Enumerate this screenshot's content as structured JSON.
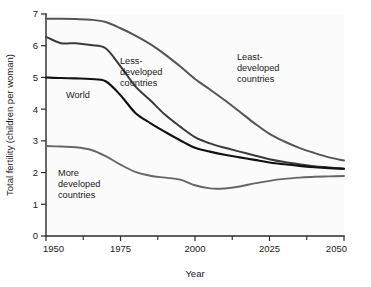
{
  "chart_data": {
    "type": "line",
    "title": "",
    "xlabel": "Year",
    "ylabel": "Total fertility (children per woman)",
    "xlim": [
      1950,
      2050
    ],
    "ylim": [
      0,
      7
    ],
    "grid": false,
    "legend_position": "inline-annotations",
    "x_ticks": [
      1950,
      1975,
      2000,
      2025,
      2050
    ],
    "x_minor_ticks": [
      1962.5,
      1987.5,
      2012.5,
      2037.5
    ],
    "y_ticks": [
      0,
      1,
      2,
      3,
      4,
      5,
      6,
      7
    ],
    "x": [
      1950,
      1955,
      1960,
      1965,
      1970,
      1975,
      1980,
      1985,
      1990,
      1995,
      2000,
      2005,
      2010,
      2015,
      2020,
      2025,
      2030,
      2035,
      2040,
      2045,
      2050
    ],
    "series": [
      {
        "name": "Least-developed countries",
        "color": "#555555",
        "width": 2.0,
        "values": [
          6.85,
          6.85,
          6.84,
          6.82,
          6.75,
          6.55,
          6.32,
          6.05,
          5.72,
          5.35,
          4.95,
          4.62,
          4.28,
          3.92,
          3.55,
          3.22,
          2.98,
          2.78,
          2.62,
          2.48,
          2.38
        ]
      },
      {
        "name": "Less-developed countries",
        "color": "#3a3a3a",
        "width": 2.0,
        "values": [
          6.28,
          6.08,
          6.08,
          6.02,
          5.92,
          5.35,
          4.72,
          4.28,
          3.82,
          3.45,
          3.12,
          2.92,
          2.78,
          2.66,
          2.54,
          2.42,
          2.33,
          2.26,
          2.2,
          2.16,
          2.12
        ]
      },
      {
        "name": "World",
        "color": "#111111",
        "width": 2.1,
        "values": [
          5.0,
          4.98,
          4.97,
          4.95,
          4.88,
          4.44,
          3.88,
          3.56,
          3.28,
          3.02,
          2.78,
          2.66,
          2.56,
          2.48,
          2.4,
          2.32,
          2.26,
          2.21,
          2.17,
          2.14,
          2.12
        ]
      },
      {
        "name": "More developed countries",
        "color": "#666666",
        "width": 1.9,
        "values": [
          2.84,
          2.82,
          2.8,
          2.72,
          2.52,
          2.25,
          2.02,
          1.9,
          1.84,
          1.78,
          1.6,
          1.5,
          1.5,
          1.56,
          1.66,
          1.74,
          1.8,
          1.84,
          1.87,
          1.88,
          1.89
        ]
      }
    ],
    "annotations": [
      {
        "id": "less-developed",
        "lines": [
          "Less-",
          "developed",
          "countries"
        ],
        "x": 120,
        "y": 64
      },
      {
        "id": "least-developed",
        "lines": [
          "Least-",
          "developed",
          "countries"
        ],
        "x": 237,
        "y": 60
      },
      {
        "id": "world",
        "lines": [
          "World"
        ],
        "x": 66,
        "y": 94
      },
      {
        "id": "more-developed",
        "lines": [
          "More",
          "developed",
          "countries"
        ],
        "x": 58,
        "y": 176
      }
    ]
  },
  "labels": {
    "y_ticks": [
      "0",
      "1",
      "2",
      "3",
      "4",
      "5",
      "6",
      "7"
    ],
    "x_ticks": [
      "1950",
      "1975",
      "2000",
      "2025",
      "2050"
    ],
    "x_axis_title": "Year",
    "y_axis_title": "Total fertility (children per woman)",
    "annot_less_1": "Less-",
    "annot_less_2": "developed",
    "annot_less_3": "countries",
    "annot_least_1": "Least-",
    "annot_least_2": "developed",
    "annot_least_3": "countries",
    "annot_world": "World",
    "annot_more_1": "More",
    "annot_more_2": "developed",
    "annot_more_3": "countries"
  }
}
